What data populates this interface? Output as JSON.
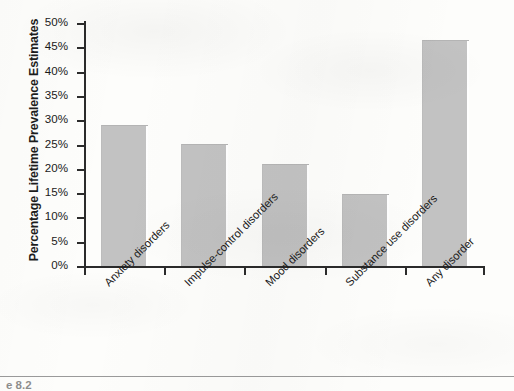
{
  "chart_data": {
    "type": "bar",
    "title": "",
    "xlabel": "",
    "ylabel": "Percentage Lifetime Prevalence Estimates",
    "categories": [
      "Anxiety disorders",
      "Impulse-control disorders",
      "Mood disorders",
      "Substance use disorders",
      "Any disorder"
    ],
    "values": [
      28.8,
      24.8,
      20.8,
      14.6,
      46.4
    ],
    "ylim": [
      0,
      50
    ],
    "ytick_labels": [
      "50%",
      "45%",
      "40%",
      "35%",
      "30%",
      "25%",
      "20%",
      "15%",
      "10%",
      "5%",
      "0%"
    ],
    "ytick_values": [
      50,
      45,
      40,
      35,
      30,
      25,
      20,
      15,
      10,
      5,
      0
    ],
    "grid": false,
    "legend": "none",
    "bar_color": "#c2c2c2",
    "axis_color": "#2b2b2b"
  },
  "footer": {
    "caption": "e 8.2"
  }
}
